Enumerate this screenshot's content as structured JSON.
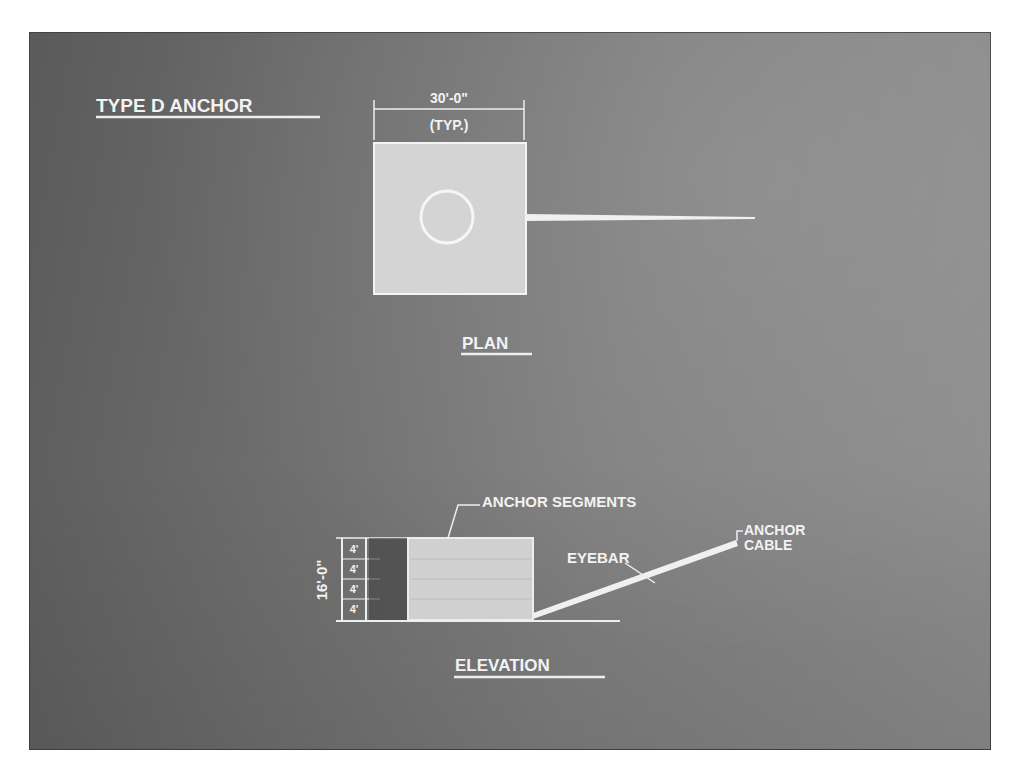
{
  "title": "TYPE D ANCHOR",
  "plan": {
    "label": "PLAN",
    "dimension": "30'-0\"",
    "dimension_note": "(TYP.)"
  },
  "elevation": {
    "label": "ELEVATION",
    "height_dimension": "16'-0\"",
    "segment_dimensions": [
      "4'",
      "4'",
      "4'",
      "4'"
    ],
    "callouts": {
      "segments": "ANCHOR SEGMENTS",
      "eyebar": "EYEBAR",
      "cable_line1": "ANCHOR",
      "cable_line2": "CABLE"
    }
  },
  "colors": {
    "background": "#6e6e6e",
    "linework": "#eeeeee",
    "block_fill": "#d6d6d6"
  }
}
